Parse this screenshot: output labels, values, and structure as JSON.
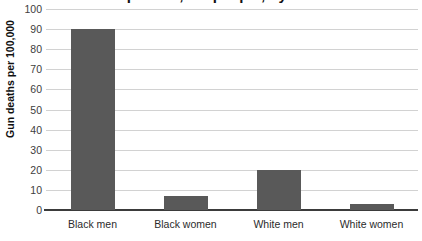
{
  "chart_data": {
    "type": "bar",
    "title": "Gun deaths per 100,000 people, by race and sex",
    "xlabel": "",
    "ylabel": "Gun deaths per 100,000",
    "categories": [
      "Black men",
      "Black women",
      "White men",
      "White women"
    ],
    "values": [
      90,
      7,
      20,
      3
    ],
    "series": [
      {
        "name": "Gun deaths per 100,000",
        "values": [
          90,
          7,
          20,
          3
        ]
      }
    ],
    "ylim": [
      0,
      100
    ],
    "y_ticks": [
      0,
      10,
      20,
      30,
      40,
      50,
      60,
      70,
      80,
      90,
      100
    ],
    "y_tick_labels": [
      "0",
      "10",
      "20",
      "30",
      "40",
      "50",
      "60",
      "70",
      "80",
      "90",
      "100"
    ],
    "grid": "horizontal",
    "legend": "none",
    "bar_color": "#595959",
    "gridline_color": "#d2d2d2",
    "axis_color": "#3b3b3b",
    "background_color": "#ffffff",
    "title_cropped": true
  }
}
